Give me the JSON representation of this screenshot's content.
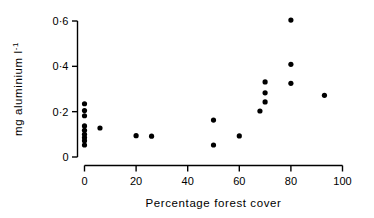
{
  "chart_data": {
    "type": "scatter",
    "title": "",
    "xlabel": "Percentage forest cover",
    "ylabel": "mg aluminium l⁻¹",
    "ylabel_main": "mg aluminium l",
    "ylabel_sup": "-1",
    "xlim": [
      0,
      100
    ],
    "ylim": [
      0,
      0.6
    ],
    "xticks": [
      0,
      20,
      40,
      60,
      80,
      100
    ],
    "xtick_labels": [
      "0",
      "20",
      "40",
      "60",
      "80",
      "100"
    ],
    "yticks": [
      0,
      0.2,
      0.4,
      0.6
    ],
    "ytick_labels": [
      "0",
      "0·2",
      "0·4",
      "0·6"
    ],
    "grid": false,
    "legend": null,
    "marker": "filled-circle",
    "marker_color": "#000000",
    "marker_size_px": 3.4,
    "points": [
      {
        "x": 0,
        "y": 0.235
      },
      {
        "x": 0,
        "y": 0.205
      },
      {
        "x": 0,
        "y": 0.182
      },
      {
        "x": 0,
        "y": 0.137
      },
      {
        "x": 0,
        "y": 0.118
      },
      {
        "x": 0,
        "y": 0.1
      },
      {
        "x": 0,
        "y": 0.086
      },
      {
        "x": 0,
        "y": 0.072
      },
      {
        "x": 0,
        "y": 0.053
      },
      {
        "x": 6,
        "y": 0.128
      },
      {
        "x": 20,
        "y": 0.094
      },
      {
        "x": 26,
        "y": 0.092
      },
      {
        "x": 50,
        "y": 0.053
      },
      {
        "x": 50,
        "y": 0.163
      },
      {
        "x": 60,
        "y": 0.093
      },
      {
        "x": 68,
        "y": 0.203
      },
      {
        "x": 70,
        "y": 0.243
      },
      {
        "x": 70,
        "y": 0.283
      },
      {
        "x": 70,
        "y": 0.331
      },
      {
        "x": 80,
        "y": 0.604
      },
      {
        "x": 80,
        "y": 0.409
      },
      {
        "x": 80,
        "y": 0.325
      },
      {
        "x": 93,
        "y": 0.272
      }
    ]
  },
  "figure": {
    "caption": ""
  }
}
